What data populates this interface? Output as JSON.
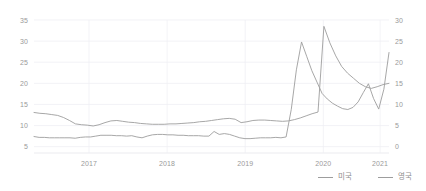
{
  "chart_data": {
    "type": "line",
    "title": "",
    "subtitle": "",
    "xlabel": "",
    "ylabel": "",
    "grid": true,
    "legend_position": "bottom-right",
    "x_tick_labels": [
      "2017",
      "2018",
      "2019",
      "2020",
      "2021"
    ],
    "x_tick_positions": [
      0.155,
      0.375,
      0.595,
      0.815,
      0.975
    ],
    "x_range_start": "2016-07",
    "x_range_end": "2021-05",
    "axes": {
      "left": {
        "label": "",
        "ticks": [
          "35",
          "30",
          "25",
          "20",
          "15",
          "10",
          "5"
        ],
        "values": [
          35,
          30,
          25,
          20,
          15,
          10,
          5
        ],
        "min": 3.5,
        "max": 35
      },
      "right": {
        "label": "",
        "ticks": [
          "30",
          "25",
          "20",
          "15",
          "10",
          "5",
          "0"
        ],
        "values": [
          30,
          25,
          20,
          15,
          10,
          5,
          0
        ],
        "min": -1.5,
        "max": 30
      }
    },
    "series": [
      {
        "name": "미국",
        "axis": "left",
        "color": "#9d9d9d",
        "values": [
          13.1,
          12.9,
          12.8,
          12.6,
          12.4,
          11.9,
          11.2,
          10.4,
          10.2,
          10.1,
          9.9,
          10.2,
          10.7,
          11.1,
          11.2,
          11.0,
          10.8,
          10.7,
          10.5,
          10.4,
          10.3,
          10.3,
          10.3,
          10.4,
          10.4,
          10.5,
          10.6,
          10.7,
          10.9,
          11.0,
          11.2,
          11.4,
          11.6,
          11.7,
          11.5,
          10.7,
          10.9,
          11.2,
          11.3,
          11.3,
          11.2,
          11.1,
          11.0,
          11.1,
          11.4,
          11.8,
          12.3,
          12.8,
          13.2,
          33.5,
          29.6,
          26.5,
          24.0,
          22.4,
          21.2,
          20.0,
          19.2,
          18.8,
          19.2,
          19.7,
          20.0
        ]
      },
      {
        "name": "영국",
        "axis": "right",
        "color": "#9d9d9d",
        "values": [
          2.4,
          2.2,
          2.2,
          2.1,
          2.1,
          2.1,
          2.1,
          2.1,
          2.0,
          2.2,
          2.3,
          2.3,
          2.5,
          2.7,
          2.7,
          2.7,
          2.6,
          2.6,
          2.5,
          2.6,
          2.3,
          2.1,
          2.5,
          2.8,
          2.9,
          2.9,
          2.8,
          2.8,
          2.7,
          2.7,
          2.6,
          2.6,
          2.6,
          2.5,
          2.5,
          3.6,
          2.9,
          3.1,
          2.9,
          2.5,
          2.1,
          1.9,
          1.9,
          2.0,
          2.1,
          2.1,
          2.1,
          2.2,
          2.1,
          2.3,
          8.8,
          18.2,
          24.8,
          21.4,
          18.0,
          15.3,
          12.6,
          11.3,
          10.3,
          9.6,
          9.0,
          8.8,
          9.3,
          10.6,
          12.8,
          14.9,
          11.4,
          8.9,
          13.6,
          22.3
        ]
      }
    ]
  },
  "legend": {
    "items": [
      {
        "label": "미국"
      },
      {
        "label": "영국"
      }
    ]
  }
}
